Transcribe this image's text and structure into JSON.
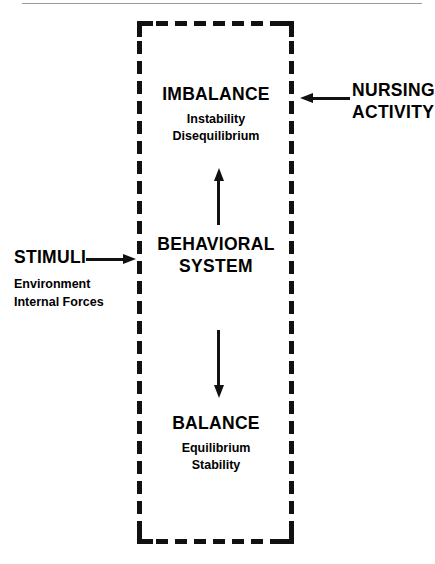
{
  "figure": {
    "background_color": "#ffffff",
    "ink_color": "#111111"
  },
  "boundary": {
    "label": "system-boundary",
    "style": "dashed-rectangle"
  },
  "nodes": {
    "imbalance": {
      "heading": "IMBALANCE",
      "sub_lines": [
        "Instability",
        "Disequilibrium"
      ]
    },
    "behavioral_system": {
      "heading_line1": "BEHAVIORAL",
      "heading_line2": "SYSTEM"
    },
    "balance": {
      "heading": "BALANCE",
      "sub_lines": [
        "Equilibrium",
        "Stability"
      ]
    }
  },
  "external_labels": {
    "nursing_activity": {
      "title_line1": "NURSING",
      "title_line2": "ACTIVITY"
    },
    "stimuli": {
      "title": "STIMULI",
      "detail_lines": [
        "Environment",
        "Internal Forces"
      ]
    }
  },
  "arrows": {
    "behavioral_to_imbalance": {
      "name": "up-arrow",
      "direction": "up"
    },
    "behavioral_to_balance": {
      "name": "down-arrow",
      "direction": "down"
    },
    "nursing_to_system": {
      "name": "left-arrow",
      "direction": "left"
    },
    "stimuli_to_system": {
      "name": "right-arrow",
      "direction": "right"
    }
  }
}
